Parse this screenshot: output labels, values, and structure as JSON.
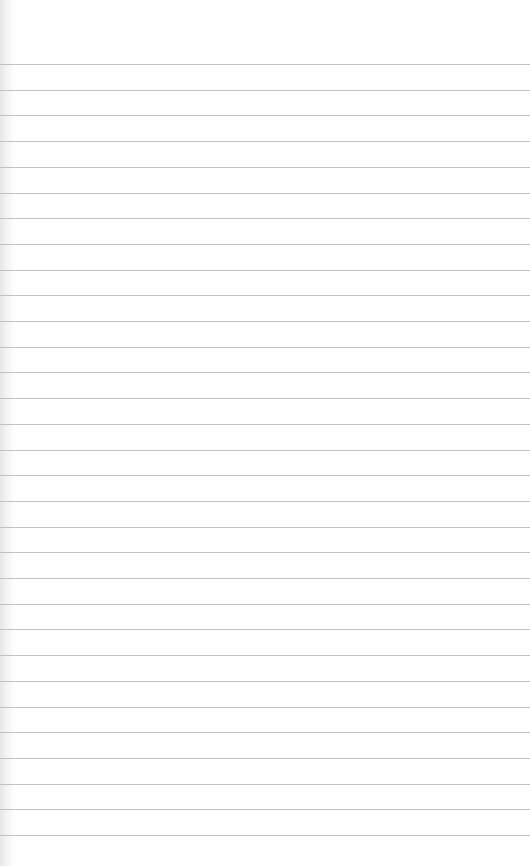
{
  "paper": {
    "type": "lined-paper",
    "background_color": "#fefefe",
    "line_color": "#b9b9b9",
    "first_line_y": 64,
    "line_spacing": 25.7,
    "line_count": 31
  }
}
